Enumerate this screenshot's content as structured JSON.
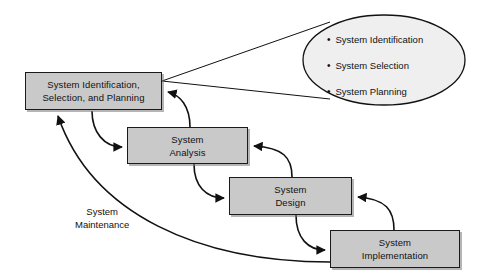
{
  "diagram": {
    "background_color": "#ffffff",
    "box_fill_color": "#c9c9c9",
    "box_border_color": "#1a1a1a",
    "ellipse_fill_color": "#efefef",
    "line_color": "#111111",
    "nodes": [
      {
        "id": "identification",
        "label": "System Identification,\nSelection, and Planning",
        "x": 25,
        "y": 72,
        "w": 137,
        "h": 38
      },
      {
        "id": "analysis",
        "label": "System\nAnalysis",
        "x": 127,
        "y": 127,
        "w": 121,
        "h": 37
      },
      {
        "id": "design",
        "label": "System\nDesign",
        "x": 229,
        "y": 177,
        "w": 123,
        "h": 38
      },
      {
        "id": "implementation",
        "label": "System\nImplementation",
        "x": 330,
        "y": 230,
        "w": 130,
        "h": 38
      }
    ],
    "callout": {
      "id": "identification-detail",
      "cx": 384,
      "cy": 60,
      "rx": 81,
      "ry": 45,
      "bullet_glyph": "•",
      "items": [
        "System Identification",
        "System Selection",
        "System Planning"
      ]
    },
    "edge_labels": [
      {
        "id": "maintenance",
        "text": "System\nMaintenance",
        "x": 75,
        "y": 205
      }
    ]
  }
}
